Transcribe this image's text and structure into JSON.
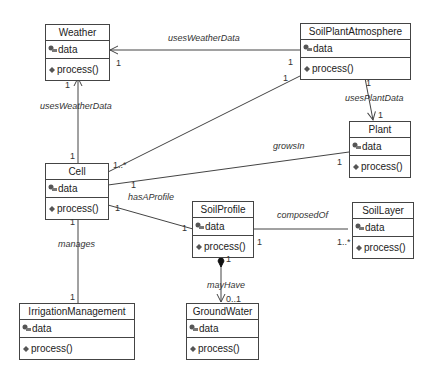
{
  "classes": {
    "weather": {
      "name": "Weather",
      "attr": "data",
      "op": "process()"
    },
    "soilPlantAtmosphere": {
      "name": "SoilPlantAtmosphere",
      "attr": "data",
      "op": "process()"
    },
    "plant": {
      "name": "Plant",
      "attr": "data",
      "op": "process()"
    },
    "cell": {
      "name": "Cell",
      "attr": "data",
      "op": "process()"
    },
    "soilProfile": {
      "name": "SoilProfile",
      "attr": "data",
      "op": "process()"
    },
    "soilLayer": {
      "name": "SoilLayer",
      "attr": "data",
      "op": "process()"
    },
    "irrigationManagement": {
      "name": "IrrigationManagement",
      "attr": "data",
      "op": "process()"
    },
    "groundWater": {
      "name": "GroundWater",
      "attr": "data",
      "op": "process()"
    }
  },
  "associations": {
    "spa_weather": {
      "label": "usesWeatherData",
      "m_target": "1",
      "m_source": "1"
    },
    "cell_weather": {
      "label": "usesWeatherData",
      "m_target": "1",
      "m_source": "1"
    },
    "spa_plant": {
      "label": "usesPlantData",
      "m_source": "1",
      "m_target": "1"
    },
    "cell_spa": {
      "m_cell": "1..*",
      "m_spa": "1"
    },
    "cell_plant": {
      "label": "growsIn",
      "m_cell": "1",
      "m_plant": "1"
    },
    "cell_soilprofile": {
      "label": "hasAProfile",
      "m_cell": "1",
      "m_profile": "1"
    },
    "soilprofile_soillayer": {
      "label": "composedOf",
      "m_profile": "1",
      "m_layer": "1..*"
    },
    "soilprofile_groundwater": {
      "label": "mayHave",
      "m_profile": "1",
      "m_water": "0..1"
    },
    "cell_irrigation": {
      "label": "manages",
      "m_cell": "1",
      "m_irrigation": "1"
    }
  },
  "icons": {
    "attribute": "attribute-key-icon",
    "operation": "operation-diamond-icon"
  }
}
